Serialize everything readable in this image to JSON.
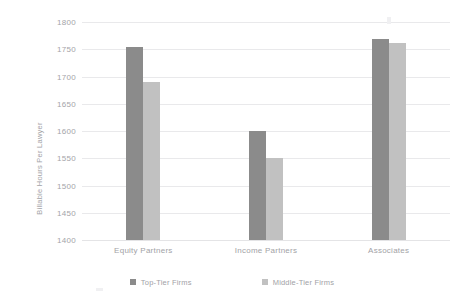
{
  "chart_data": {
    "type": "bar",
    "title": "",
    "subtitle": "",
    "xlabel": "",
    "ylabel": "Billable Hours Per Lawyer",
    "categories": [
      "Equity Partners",
      "Income Partners",
      "Associates"
    ],
    "series": [
      {
        "name": "Top-Tier Firms",
        "color": "#8b8b8b",
        "values": [
          1755,
          1600,
          1769
        ]
      },
      {
        "name": "Middle-Tier Firms",
        "color": "#c1c1c1",
        "values": [
          1690,
          1550,
          1761
        ]
      }
    ],
    "ylim": [
      1400,
      1800
    ],
    "ytick_labels": [
      "1800",
      "1750",
      "1700",
      "1650",
      "1600",
      "1550",
      "1500",
      "1450",
      "1400"
    ],
    "ytick_values": [
      1800,
      1750,
      1700,
      1650,
      1600,
      1550,
      1500,
      1450,
      1400
    ],
    "grid": true,
    "grid_axis": "y",
    "legend_position": "bottom",
    "legend_entries": [
      "Top-Tier Firms",
      "Middle-Tier Firms"
    ],
    "annotations": [],
    "background_color": "#ffffff",
    "gridline_color": "#e9e9eb",
    "text_color": "#a2a2a6"
  }
}
